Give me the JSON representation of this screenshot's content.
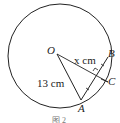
{
  "figure": {
    "caption": "图 2",
    "points": {
      "O": "O",
      "A": "A",
      "B": "B",
      "C": "C"
    },
    "labels": {
      "radius": "13 cm",
      "distance": "x cm"
    },
    "colors": {
      "stroke": "#222222"
    }
  }
}
